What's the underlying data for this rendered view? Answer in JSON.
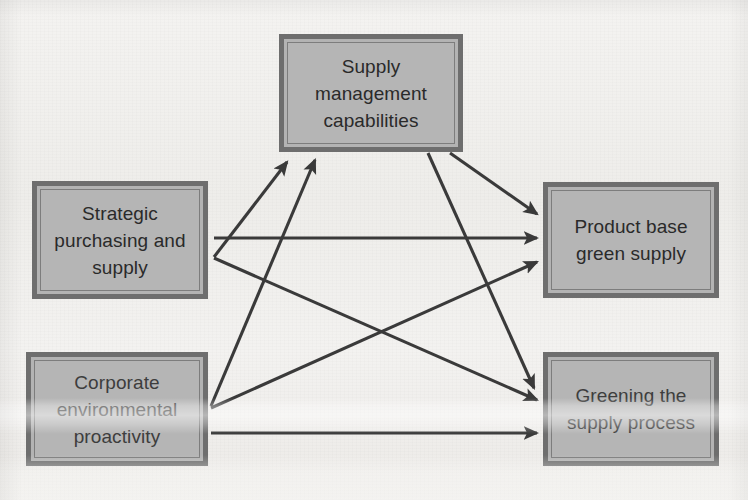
{
  "diagram": {
    "background_color": "#f2f1ef",
    "node_fill_color": "#b3b3b3",
    "node_border_color": "#6e6e6e",
    "connector_color": "#3a3a3a",
    "text_color": "#2a2a2a",
    "nodes": [
      {
        "id": "supply-management",
        "label": "Supply\nmanagement\ncapabilities",
        "lines": [
          "Supply",
          "management",
          "capabilities"
        ],
        "x": 279,
        "y": 34,
        "width": 184,
        "height": 118
      },
      {
        "id": "strategic-purchasing",
        "label": "Strategic\npurchasing and\nsupply",
        "lines": [
          "Strategic",
          "purchasing and",
          "supply"
        ],
        "x": 32,
        "y": 181,
        "width": 176,
        "height": 118
      },
      {
        "id": "product-base",
        "label": "Product base\ngreen supply",
        "lines": [
          "Product base",
          "green supply"
        ],
        "x": 543,
        "y": 182,
        "width": 176,
        "height": 116
      },
      {
        "id": "corporate-env",
        "label": "Corporate\nenvironmental\nproactivity",
        "lines": [
          "Corporate",
          "environmental",
          "proactivity"
        ],
        "x": 26,
        "y": 352,
        "width": 182,
        "height": 114
      },
      {
        "id": "greening-process",
        "label": "Greening the\nsupply process",
        "lines": [
          "Greening the",
          "supply process"
        ],
        "x": 543,
        "y": 352,
        "width": 176,
        "height": 114
      }
    ],
    "edges": [
      {
        "id": "strategic-to-supply-management",
        "from": "strategic-purchasing",
        "to": "supply-management",
        "x1": 214,
        "y1": 257,
        "x2": 287,
        "y2": 162
      },
      {
        "id": "corporate-to-supply-management",
        "from": "corporate-env",
        "to": "supply-management",
        "x1": 211,
        "y1": 406,
        "x2": 315,
        "y2": 160
      },
      {
        "id": "strategic-to-product-base",
        "from": "strategic-purchasing",
        "to": "product-base",
        "x1": 214,
        "y1": 238,
        "x2": 537,
        "y2": 238
      },
      {
        "id": "strategic-to-greening-process",
        "from": "strategic-purchasing",
        "to": "greening-process",
        "x1": 214,
        "y1": 258,
        "x2": 537,
        "y2": 400
      },
      {
        "id": "corporate-to-product-base",
        "from": "corporate-env",
        "to": "product-base",
        "x1": 211,
        "y1": 408,
        "x2": 537,
        "y2": 262
      },
      {
        "id": "corporate-to-greening-process",
        "from": "corporate-env",
        "to": "greening-process",
        "x1": 211,
        "y1": 433,
        "x2": 537,
        "y2": 433
      },
      {
        "id": "supply-management-to-product-base",
        "from": "supply-management",
        "to": "product-base",
        "x1": 450,
        "y1": 153,
        "x2": 537,
        "y2": 214
      },
      {
        "id": "supply-management-to-greening-process",
        "from": "supply-management",
        "to": "greening-process",
        "x1": 428,
        "y1": 153,
        "x2": 534,
        "y2": 388
      }
    ]
  }
}
